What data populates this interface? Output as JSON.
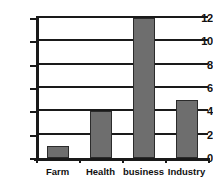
{
  "chart_data": {
    "type": "bar",
    "title": "",
    "subtitle": "",
    "xlabel": "",
    "ylabel": "",
    "categories": [
      "Farm",
      "Health",
      "business",
      "Industry"
    ],
    "values": [
      1,
      4,
      12,
      5
    ],
    "series": [
      {
        "name": "count",
        "values": [
          1,
          4,
          12,
          5
        ]
      }
    ],
    "ylim": [
      0,
      12
    ],
    "yticks": [
      0,
      2,
      4,
      6,
      8,
      10,
      12
    ],
    "ytick_labels": [
      "0",
      "2",
      "4",
      "6",
      "8",
      "10",
      "12"
    ],
    "grid": true,
    "grid_axis": "y",
    "legend": false,
    "legend_position": "none",
    "annotations": [],
    "colors": {
      "bar_fill": "#6e6e6e",
      "bar_edge": "#2b2b2b",
      "axis": "#1a1a1a",
      "gridline": "#1a1a1a",
      "background": "#ffffff",
      "text": "#111111"
    }
  }
}
